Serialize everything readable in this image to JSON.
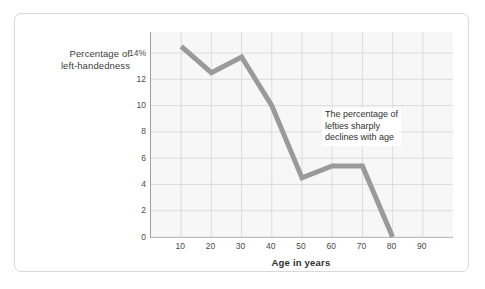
{
  "figure": {
    "background_color": "#ffffff",
    "card_border_color": "#d9d9d9"
  },
  "chart_data": {
    "type": "line",
    "title": "",
    "subtitle": "",
    "xlabel": "Age in years",
    "ylabel": "Percentage of left-handedness",
    "ylabel_lines": [
      "Percentage of",
      "left-handedness"
    ],
    "x": [
      10,
      20,
      30,
      40,
      50,
      60,
      70,
      80
    ],
    "values": [
      14.5,
      12.5,
      13.7,
      10.0,
      4.5,
      5.4,
      5.4,
      0.0
    ],
    "series": [
      {
        "name": "Percentage of left-handedness",
        "values": [
          14.5,
          12.5,
          13.7,
          10.0,
          4.5,
          5.4,
          5.4,
          0.0
        ],
        "color": "#9a9a9a",
        "line_width": 5
      }
    ],
    "xlim": [
      0,
      100
    ],
    "ylim": [
      0,
      15.6
    ],
    "x_ticks": [
      10,
      20,
      30,
      40,
      50,
      60,
      70,
      80,
      90
    ],
    "x_tick_labels": [
      "10",
      "20",
      "30",
      "40",
      "50",
      "60",
      "70",
      "80",
      "90"
    ],
    "y_ticks": [
      0,
      2,
      4,
      6,
      8,
      10,
      12,
      14
    ],
    "y_tick_labels": [
      "0",
      "2",
      "4",
      "6",
      "8",
      "10",
      "12",
      "14%"
    ],
    "grid": true,
    "grid_color": "#dcdcdc",
    "plot_background": "#f7f7f7",
    "axis_color": "#9e9e9e",
    "legend": false,
    "legend_position": "none",
    "annotations": [
      {
        "name": "trend-note",
        "lines": [
          "The percentage of",
          "lefties sharply",
          "declines with age"
        ],
        "text": "The percentage of lefties sharply declines with age",
        "x": 57,
        "y": 9.4,
        "background": "#ffffff"
      }
    ]
  }
}
